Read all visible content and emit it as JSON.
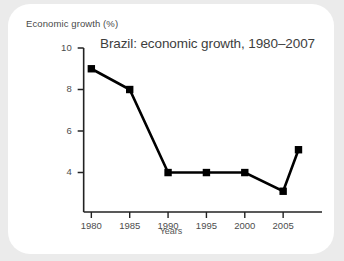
{
  "card": {
    "background_color": "#ffffff",
    "page_background_color": "#ebebeb"
  },
  "labels": {
    "y_axis_title": "Economic growth (%)",
    "x_axis_title": "Years",
    "chart_title": "Brazil: economic growth, 1980–2007"
  },
  "chart_data": {
    "type": "line",
    "title": "Brazil: economic growth, 1980–2007",
    "xlabel": "Years",
    "ylabel": "Economic growth (%)",
    "x": [
      1980,
      1985,
      1990,
      1995,
      2000,
      2005,
      2007
    ],
    "values": [
      9,
      8,
      4,
      4,
      4,
      3.1,
      5.1
    ],
    "series": [
      {
        "name": "Economic growth",
        "values": [
          9,
          8,
          4,
          4,
          4,
          3.1,
          5.1
        ],
        "color": "#000000",
        "marker": "square"
      }
    ],
    "xlim": [
      1978,
      2008.5
    ],
    "ylim": [
      2.1,
      10
    ],
    "xticks": [
      1980,
      1985,
      1990,
      1995,
      2000,
      2005
    ],
    "xtick_labels": [
      "1980",
      "1985",
      "1990",
      "1995",
      "2000",
      "2005"
    ],
    "yticks": [
      4,
      6,
      8,
      10
    ],
    "ytick_labels": [
      "4",
      "6",
      "8",
      "10"
    ],
    "grid": false,
    "legend": false
  }
}
